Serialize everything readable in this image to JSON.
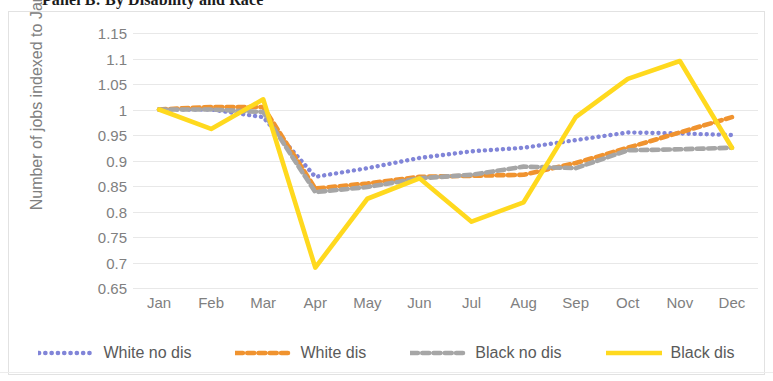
{
  "panel": {
    "title": "Panel B: By Disability and Race"
  },
  "legend": {
    "position": "bottom",
    "items": [
      {
        "label": "White no dis",
        "color": "#8185d8",
        "style": "dotted"
      },
      {
        "label": "White dis",
        "color": "#f0932f",
        "style": "dashed"
      },
      {
        "label": "Black no dis",
        "color": "#a6a6a6",
        "style": "dashed"
      },
      {
        "label": "Black dis",
        "color": "#ffd91e",
        "style": "solid"
      }
    ]
  },
  "chart_data": {
    "type": "line",
    "title": "Panel B: By Disability and Race",
    "xlabel": "",
    "ylabel": "Number of jobs indexed to January",
    "categories": [
      "Jan",
      "Feb",
      "Mar",
      "Apr",
      "May",
      "Jun",
      "Jul",
      "Aug",
      "Sep",
      "Oct",
      "Nov",
      "Dec"
    ],
    "ylim": [
      0.65,
      1.15
    ],
    "ytick_step": 0.05,
    "yticks": [
      "1.15",
      "1.1",
      "1.05",
      "1",
      "0.95",
      "0.9",
      "0.85",
      "0.8",
      "0.75",
      "0.7",
      "0.65"
    ],
    "grid": true,
    "legend_position": "bottom",
    "series": [
      {
        "name": "White no dis",
        "color": "#8185d8",
        "line_style": "dotted",
        "values": [
          1.0,
          1.0,
          0.985,
          0.868,
          0.885,
          0.905,
          0.918,
          0.925,
          0.94,
          0.955,
          0.953,
          0.95
        ]
      },
      {
        "name": "White dis",
        "color": "#f0932f",
        "line_style": "dashed",
        "values": [
          1.0,
          1.005,
          1.005,
          0.845,
          0.855,
          0.868,
          0.87,
          0.872,
          0.895,
          0.925,
          0.955,
          0.985
        ]
      },
      {
        "name": "Black no dis",
        "color": "#a6a6a6",
        "line_style": "dashed",
        "values": [
          1.0,
          1.0,
          0.995,
          0.838,
          0.848,
          0.865,
          0.872,
          0.888,
          0.885,
          0.92,
          0.922,
          0.925
        ]
      },
      {
        "name": "Black dis",
        "color": "#ffd91e",
        "line_style": "solid",
        "values": [
          1.0,
          0.962,
          1.02,
          0.69,
          0.825,
          0.865,
          0.78,
          0.818,
          0.985,
          1.06,
          1.095,
          0.925
        ]
      }
    ]
  }
}
